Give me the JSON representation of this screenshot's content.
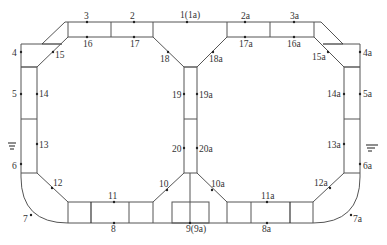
{
  "diagram": {
    "type": "structural cross-section with measurement points",
    "points": [
      {
        "id": "1",
        "label": "1(1a)",
        "x": 187,
        "y": 22,
        "lx": 180,
        "ly": 18
      },
      {
        "id": "2",
        "label": "2",
        "x": 134,
        "y": 22,
        "lx": 130,
        "ly": 19
      },
      {
        "id": "3",
        "label": "3",
        "x": 87,
        "y": 22,
        "lx": 84,
        "ly": 19
      },
      {
        "id": "4",
        "label": "4",
        "x": 21,
        "y": 52,
        "lx": 12,
        "ly": 56
      },
      {
        "id": "5",
        "label": "5",
        "x": 21,
        "y": 94,
        "lx": 12,
        "ly": 97
      },
      {
        "id": "6",
        "label": "6",
        "x": 21,
        "y": 164,
        "lx": 12,
        "ly": 169
      },
      {
        "id": "7",
        "label": "7",
        "x": 31,
        "y": 215,
        "lx": 23,
        "ly": 222
      },
      {
        "id": "8",
        "label": "8",
        "x": 114,
        "y": 223,
        "lx": 111,
        "ly": 232
      },
      {
        "id": "9",
        "label": "9(9a)",
        "x": 190,
        "y": 223,
        "lx": 186,
        "ly": 232
      },
      {
        "id": "10",
        "label": "10",
        "x": 167,
        "y": 190,
        "lx": 159,
        "ly": 187
      },
      {
        "id": "11",
        "label": "11",
        "x": 114,
        "y": 202,
        "lx": 108,
        "ly": 199
      },
      {
        "id": "12",
        "label": "12",
        "x": 52,
        "y": 188,
        "lx": 53,
        "ly": 186
      },
      {
        "id": "13",
        "label": "13",
        "x": 37,
        "y": 144,
        "lx": 39,
        "ly": 148
      },
      {
        "id": "14",
        "label": "14",
        "x": 37,
        "y": 94,
        "lx": 39,
        "ly": 97
      },
      {
        "id": "15",
        "label": "15",
        "x": 53,
        "y": 52,
        "lx": 55,
        "ly": 58
      },
      {
        "id": "16",
        "label": "16",
        "x": 87,
        "y": 37,
        "lx": 83,
        "ly": 47
      },
      {
        "id": "17",
        "label": "17",
        "x": 134,
        "y": 37,
        "lx": 130,
        "ly": 47
      },
      {
        "id": "18",
        "label": "18",
        "x": 168,
        "y": 52,
        "lx": 160,
        "ly": 62
      },
      {
        "id": "19",
        "label": "19",
        "x": 184,
        "y": 94,
        "lx": 172,
        "ly": 98
      },
      {
        "id": "20",
        "label": "20",
        "x": 184,
        "y": 148,
        "lx": 172,
        "ly": 152
      },
      {
        "id": "2a",
        "label": "2a",
        "x": 245,
        "y": 22,
        "lx": 241,
        "ly": 19
      },
      {
        "id": "3a",
        "label": "3a",
        "x": 294,
        "y": 22,
        "lx": 290,
        "ly": 19
      },
      {
        "id": "4a",
        "label": "4a",
        "x": 360,
        "y": 52,
        "lx": 363,
        "ly": 56
      },
      {
        "id": "5a",
        "label": "5a",
        "x": 360,
        "y": 94,
        "lx": 363,
        "ly": 97
      },
      {
        "id": "6a",
        "label": "6a",
        "x": 360,
        "y": 164,
        "lx": 363,
        "ly": 169
      },
      {
        "id": "7a",
        "label": "7a",
        "x": 351,
        "y": 215,
        "lx": 353,
        "ly": 222
      },
      {
        "id": "8a",
        "label": "8a",
        "x": 267,
        "y": 223,
        "lx": 262,
        "ly": 232
      },
      {
        "id": "10a",
        "label": "10a",
        "x": 212,
        "y": 190,
        "lx": 211,
        "ly": 187
      },
      {
        "id": "11a",
        "label": "11a",
        "x": 267,
        "y": 202,
        "lx": 261,
        "ly": 199
      },
      {
        "id": "12a",
        "label": "12a",
        "x": 330,
        "y": 188,
        "lx": 314,
        "ly": 186
      },
      {
        "id": "13a",
        "label": "13a",
        "x": 344,
        "y": 144,
        "lx": 327,
        "ly": 148
      },
      {
        "id": "14a",
        "label": "14a",
        "x": 344,
        "y": 94,
        "lx": 327,
        "ly": 97
      },
      {
        "id": "15a",
        "label": "15a",
        "x": 328,
        "y": 52,
        "lx": 312,
        "ly": 60
      },
      {
        "id": "16a",
        "label": "16a",
        "x": 294,
        "y": 37,
        "lx": 287,
        "ly": 47
      },
      {
        "id": "17a",
        "label": "17a",
        "x": 245,
        "y": 37,
        "lx": 239,
        "ly": 47
      },
      {
        "id": "18a",
        "label": "18a",
        "x": 213,
        "y": 52,
        "lx": 209,
        "ly": 62
      },
      {
        "id": "19a",
        "label": "19a",
        "x": 197,
        "y": 94,
        "lx": 199,
        "ly": 98
      },
      {
        "id": "20a",
        "label": "20a",
        "x": 197,
        "y": 148,
        "lx": 199,
        "ly": 152
      }
    ],
    "water_level_symbols": [
      {
        "name": "water-level-left",
        "x": 12,
        "y": 145
      },
      {
        "name": "water-level-right",
        "x": 370,
        "y": 147
      }
    ]
  }
}
